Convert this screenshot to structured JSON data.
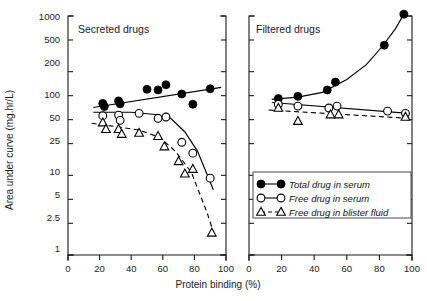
{
  "figure": {
    "width": 427,
    "height": 301,
    "background": "#ffffff",
    "ink_color": "#000000"
  },
  "axis_titles": {
    "y": "Area under curve (mg.hr/L)",
    "x": "Protein binding (%)"
  },
  "legend": {
    "position": "bottom-right, inside right panel",
    "entries": [
      {
        "label": "Total drug in serum",
        "marker": "filled-circle",
        "line": "solid"
      },
      {
        "label": "Free drug in serum",
        "marker": "open-circle",
        "line": "solid"
      },
      {
        "label": "Free drug in blister fluid",
        "marker": "open-triangle",
        "line": "dashed"
      }
    ]
  },
  "chart_data": [
    {
      "type": "scatter",
      "panel": "left",
      "title": "Secreted drugs",
      "xlabel": "Protein binding (%)",
      "ylabel": "Area under curve (mg.hr/L)",
      "xlim": [
        0,
        100
      ],
      "ylim": [
        1,
        1000
      ],
      "yscale": "log",
      "xticks": [
        0,
        20,
        40,
        60,
        80,
        100
      ],
      "yticks": [
        1,
        2.5,
        5,
        10,
        25,
        50,
        100,
        200,
        500,
        1000
      ],
      "ytick_labels": [
        "1",
        "2.5",
        "5",
        "10",
        "25",
        "50",
        "100",
        "200",
        "500",
        "1000"
      ],
      "grid": false,
      "series": [
        {
          "name": "Total drug in serum",
          "marker": "filled-circle",
          "line": "solid",
          "points": [
            {
              "x": 22,
              "y": 80
            },
            {
              "x": 23,
              "y": 73
            },
            {
              "x": 32,
              "y": 86
            },
            {
              "x": 33,
              "y": 79
            },
            {
              "x": 50,
              "y": 120
            },
            {
              "x": 57,
              "y": 118
            },
            {
              "x": 62,
              "y": 137
            },
            {
              "x": 72,
              "y": 105
            },
            {
              "x": 79,
              "y": 78
            },
            {
              "x": 90,
              "y": 122
            }
          ],
          "fit_line": {
            "from": {
              "x": 18,
              "y": 72
            },
            "to": {
              "x": 96,
              "y": 125
            }
          }
        },
        {
          "name": "Free drug in serum",
          "marker": "open-circle",
          "line": "solid",
          "points": [
            {
              "x": 22,
              "y": 56
            },
            {
              "x": 32,
              "y": 57
            },
            {
              "x": 33,
              "y": 49
            },
            {
              "x": 45,
              "y": 60
            },
            {
              "x": 57,
              "y": 52
            },
            {
              "x": 62,
              "y": 54
            },
            {
              "x": 72,
              "y": 26
            },
            {
              "x": 79,
              "y": 19
            },
            {
              "x": 90,
              "y": 9.2
            }
          ],
          "fit_line": "descending-curve"
        },
        {
          "name": "Free drug in blister fluid",
          "marker": "open-triangle",
          "line": "dashed",
          "points": [
            {
              "x": 22,
              "y": 46
            },
            {
              "x": 24,
              "y": 38
            },
            {
              "x": 32,
              "y": 38
            },
            {
              "x": 34,
              "y": 33
            },
            {
              "x": 45,
              "y": 34
            },
            {
              "x": 57,
              "y": 31
            },
            {
              "x": 61,
              "y": 23
            },
            {
              "x": 70,
              "y": 15
            },
            {
              "x": 74,
              "y": 10.5
            },
            {
              "x": 79,
              "y": 12
            },
            {
              "x": 91,
              "y": 1.9
            }
          ],
          "fit_line": "descending-dashed-curve"
        }
      ]
    },
    {
      "type": "scatter",
      "panel": "right",
      "title": "Filtered drugs",
      "xlabel": "Protein binding (%)",
      "ylabel": "Area under curve (mg.hr/L)",
      "xlim": [
        0,
        100
      ],
      "ylim": [
        1,
        1000
      ],
      "yscale": "log",
      "xticks": [
        0,
        20,
        40,
        60,
        80,
        100
      ],
      "yticks": [
        1,
        2.5,
        5,
        10,
        25,
        50,
        100,
        200,
        500,
        1000
      ],
      "grid": false,
      "series": [
        {
          "name": "Total drug in serum",
          "marker": "filled-circle",
          "line": "solid",
          "points": [
            {
              "x": 18,
              "y": 92
            },
            {
              "x": 30,
              "y": 98
            },
            {
              "x": 48,
              "y": 118
            },
            {
              "x": 53,
              "y": 148
            },
            {
              "x": 83,
              "y": 430
            },
            {
              "x": 95,
              "y": 1050
            }
          ],
          "fit_line": "rising-exponential"
        },
        {
          "name": "Free drug in serum",
          "marker": "open-circle",
          "line": "solid",
          "points": [
            {
              "x": 18,
              "y": 78
            },
            {
              "x": 30,
              "y": 74
            },
            {
              "x": 49,
              "y": 70
            },
            {
              "x": 54,
              "y": 74
            },
            {
              "x": 85,
              "y": 64
            },
            {
              "x": 96,
              "y": 60
            }
          ],
          "fit_line": {
            "from": {
              "x": 15,
              "y": 80
            },
            "to": {
              "x": 98,
              "y": 61
            }
          }
        },
        {
          "name": "Free drug in blister fluid",
          "marker": "open-triangle",
          "line": "dashed",
          "points": [
            {
              "x": 18,
              "y": 70
            },
            {
              "x": 30,
              "y": 48
            },
            {
              "x": 50,
              "y": 58
            },
            {
              "x": 55,
              "y": 58
            },
            {
              "x": 96,
              "y": 54
            }
          ],
          "fit_line": {
            "from": {
              "x": 13,
              "y": 64
            },
            "to": {
              "x": 98,
              "y": 52
            }
          }
        }
      ]
    }
  ]
}
